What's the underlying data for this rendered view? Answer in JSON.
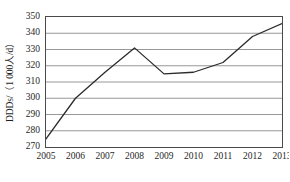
{
  "chart_data": {
    "type": "line",
    "title": "",
    "subtitle": "",
    "xlabel": "",
    "ylabel": "DDDs/（1 000人/d）",
    "categories": [
      "2005",
      "2006",
      "2007",
      "2008",
      "2009",
      "2010",
      "2011",
      "2012",
      "2013"
    ],
    "x": [
      2005,
      2006,
      2007,
      2008,
      2009,
      2010,
      2011,
      2012,
      2013
    ],
    "values": [
      275,
      300,
      316,
      331,
      315,
      316,
      322,
      338,
      346
    ],
    "series": [
      {
        "name": "DDDs",
        "values": [
          275,
          300,
          316,
          331,
          315,
          316,
          322,
          338,
          346
        ]
      }
    ],
    "ylim": [
      270,
      350
    ],
    "xlim": [
      2005,
      2013
    ],
    "yticks": [
      270,
      280,
      290,
      300,
      310,
      320,
      330,
      340,
      350
    ],
    "ytick_labels": [
      "270",
      "280",
      "290",
      "300",
      "310",
      "320",
      "330",
      "340",
      "350"
    ],
    "xtick_labels": [
      "2005",
      "2006",
      "2007",
      "2008",
      "2009",
      "2010",
      "2011",
      "2012",
      "2013"
    ],
    "grid": "horizontal",
    "legend": "none",
    "annotations": [],
    "line_color": "#2b2b2b",
    "grid_color": "#8c8c8c",
    "frame_color": "#4a4a4a",
    "background_color": "#ffffff",
    "markers": "none",
    "line_width": 1.3
  }
}
